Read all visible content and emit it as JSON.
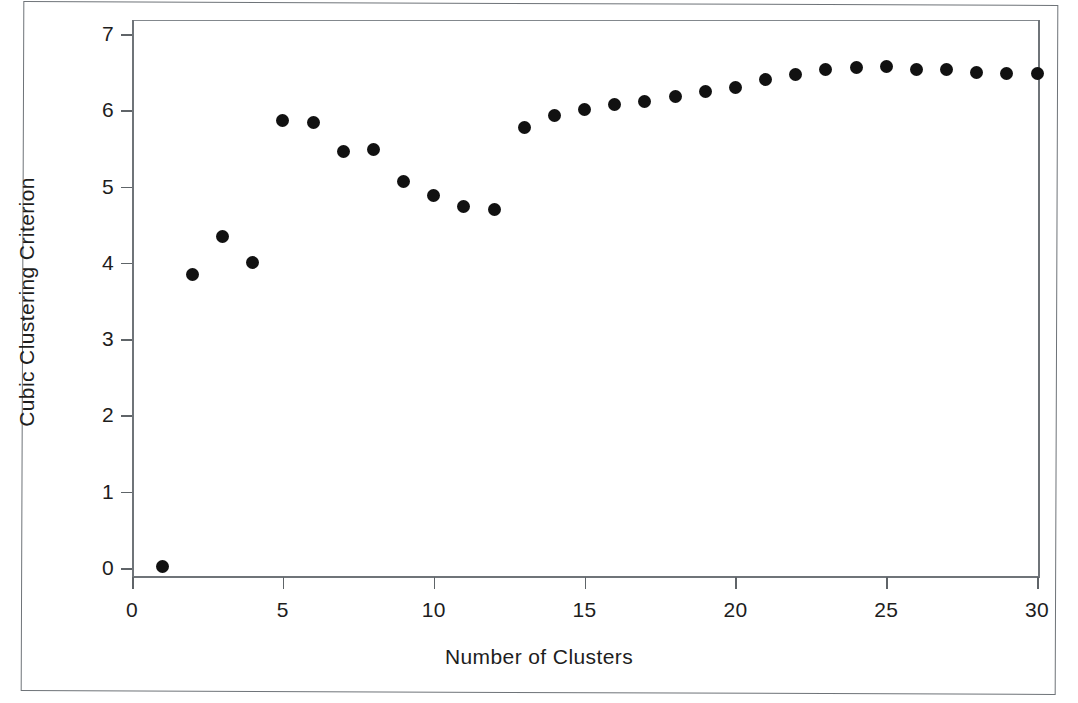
{
  "chart_data": {
    "type": "scatter",
    "title": "",
    "xlabel": "Number of Clusters",
    "ylabel": "Cubic Clustering Criterion",
    "xlim": [
      0,
      30.5
    ],
    "ylim": [
      0,
      7
    ],
    "grid": false,
    "legend": null,
    "marker": "filled-circle",
    "marker_color": "#111111",
    "xticks": [
      0,
      5,
      10,
      15,
      20,
      25,
      30
    ],
    "xtick_labels": [
      "0",
      "5",
      "10",
      "15",
      "20",
      "25",
      "30"
    ],
    "yticks": [
      0,
      1,
      2,
      3,
      4,
      5,
      6,
      7
    ],
    "ytick_labels": [
      "0",
      "1",
      "2",
      "3",
      "4",
      "5",
      "6",
      "7"
    ],
    "x": [
      1,
      2,
      3,
      4,
      5,
      6,
      7,
      8,
      9,
      10,
      11,
      12,
      13,
      14,
      15,
      16,
      17,
      18,
      19,
      20,
      21,
      22,
      23,
      24,
      25,
      26,
      27,
      28,
      29,
      30
    ],
    "y": [
      0.02,
      3.85,
      4.35,
      4.01,
      5.86,
      5.84,
      5.46,
      5.48,
      5.06,
      4.88,
      4.74,
      4.7,
      5.77,
      5.93,
      6.01,
      6.07,
      6.12,
      6.18,
      6.24,
      6.3,
      6.4,
      6.47,
      6.53,
      6.56,
      6.58,
      6.54,
      6.53,
      6.5,
      6.48,
      6.48
    ],
    "series": [
      {
        "name": "Cubic Clustering Criterion",
        "values": [
          0.02,
          3.85,
          4.35,
          4.01,
          5.86,
          5.84,
          5.46,
          5.48,
          5.06,
          4.88,
          4.74,
          4.7,
          5.77,
          5.93,
          6.01,
          6.07,
          6.12,
          6.18,
          6.24,
          6.3,
          6.4,
          6.47,
          6.53,
          6.56,
          6.58,
          6.54,
          6.53,
          6.5,
          6.48,
          6.48
        ]
      }
    ]
  },
  "figure": {
    "axis_color": "#6f7479",
    "frame_color": "#6e7378",
    "background": "#ffffff"
  }
}
